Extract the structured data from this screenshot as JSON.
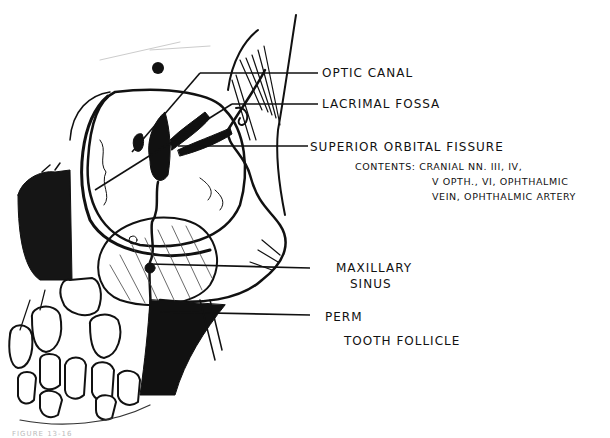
{
  "figure": {
    "caption_faint": "FIGURE 13-16"
  },
  "labels": {
    "optic_canal": "OPTIC CANAL",
    "lacrimal_fossa": "LACRIMAL FOSSA",
    "superior_orbital_fissure": "SUPERIOR ORBITAL FISSURE",
    "contents_line1": "CONTENTS: CRANIAL NN. III, IV,",
    "contents_line2": "V OPTH., VI, OPHTHALMIC",
    "contents_line3": "VEIN, OPHTHALMIC ARTERY",
    "maxillary_line1": "MAXILLARY",
    "maxillary_line2": "SINUS",
    "perm_line1": "PERM",
    "perm_line2": "TOOTH FOLLICLE"
  }
}
